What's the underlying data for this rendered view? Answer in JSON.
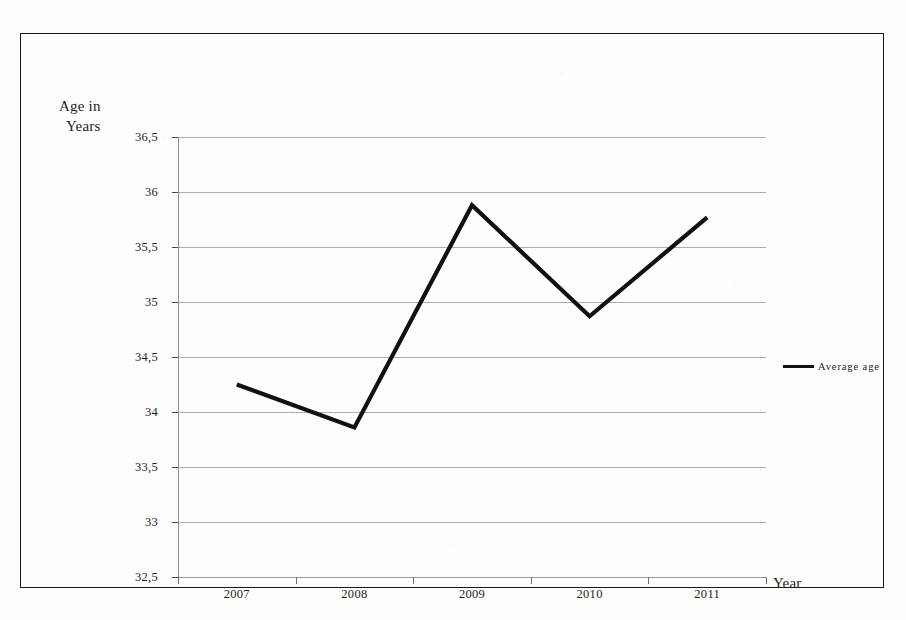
{
  "chart_data": {
    "type": "line",
    "title": "",
    "xlabel": "Year",
    "ylabel": "Age in\nYears",
    "ylabel_line1": "Age in",
    "ylabel_line2": "Years",
    "categories": [
      "2007",
      "2008",
      "2009",
      "2010",
      "2011"
    ],
    "series": [
      {
        "name": "Average age",
        "values": [
          34.25,
          33.86,
          35.88,
          34.87,
          35.77
        ],
        "color": "#111111"
      }
    ],
    "ylim": [
      32.5,
      36.5
    ],
    "ytick_values": [
      36.5,
      36,
      35.5,
      35,
      34.5,
      34,
      33.5,
      33,
      32.5
    ],
    "ytick_labels": [
      "36,5",
      "36",
      "35,5",
      "35",
      "34,5",
      "34",
      "33,5",
      "33",
      "32,5"
    ],
    "decimal_separator": ",",
    "grid": true,
    "grid_axis": "y",
    "legend_position": "right",
    "legend_entries": [
      "Average age"
    ]
  },
  "legend": {
    "label": "Average age"
  },
  "axes": {
    "x_title": "Year",
    "y_title_line1": "Age in",
    "y_title_line2": "Years"
  },
  "colors": {
    "line": "#111111",
    "grid": "#9a9a9a",
    "frame": "#1a1a1a",
    "text": "#1d1d1d",
    "background": "#fdfdfd"
  }
}
